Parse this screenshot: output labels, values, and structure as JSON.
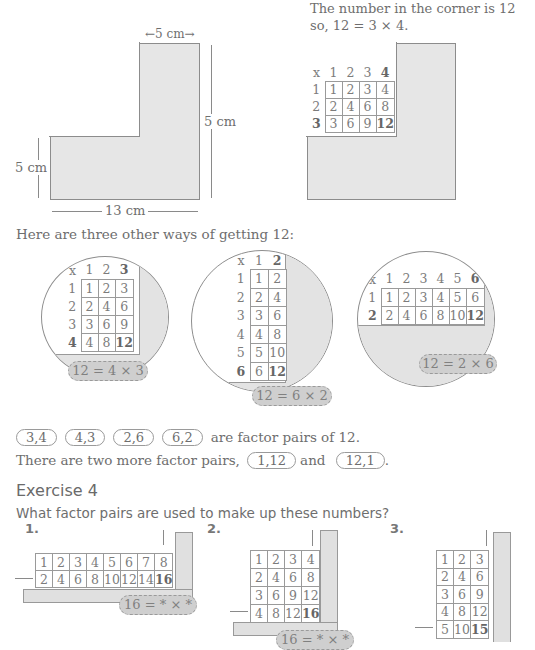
{
  "top_right_text": {
    "line1": "The number in the corner is 12",
    "line2": "so, 12 = 3 × 4."
  },
  "left_shape": {
    "top_dim": "←5 cm→",
    "right_dim": "5 cm",
    "left_dim": "5 cm",
    "bottom_dim": "13 cm"
  },
  "right_table": {
    "header": [
      "x",
      "1",
      "2",
      "3",
      "4"
    ],
    "rows": [
      [
        "1",
        "1",
        "2",
        "3",
        "4"
      ],
      [
        "2",
        "2",
        "4",
        "6",
        "8"
      ],
      [
        "3",
        "3",
        "6",
        "9",
        "12"
      ]
    ]
  },
  "intro": "Here are three other ways of getting 12:",
  "circles": [
    {
      "header": [
        "x",
        "1",
        "2",
        "3"
      ],
      "rows": [
        [
          "1",
          "1",
          "2",
          "3"
        ],
        [
          "2",
          "2",
          "4",
          "6"
        ],
        [
          "3",
          "3",
          "6",
          "9"
        ],
        [
          "4",
          "4",
          "8",
          "12"
        ]
      ],
      "label": "12 = 4 × 3"
    },
    {
      "header": [
        "x",
        "1",
        "2"
      ],
      "rows": [
        [
          "1",
          "1",
          "2"
        ],
        [
          "2",
          "2",
          "4"
        ],
        [
          "3",
          "3",
          "6"
        ],
        [
          "4",
          "4",
          "8"
        ],
        [
          "5",
          "5",
          "10"
        ],
        [
          "6",
          "6",
          "12"
        ]
      ],
      "label": "12 = 6 × 2"
    },
    {
      "header": [
        "x",
        "1",
        "2",
        "3",
        "4",
        "5",
        "6"
      ],
      "rows": [
        [
          "1",
          "1",
          "2",
          "3",
          "4",
          "5",
          "6"
        ],
        [
          "2",
          "2",
          "4",
          "6",
          "8",
          "10",
          "12"
        ]
      ],
      "label": "12 = 2 × 6"
    }
  ],
  "pairs": {
    "items": [
      "3,4",
      "4,3",
      "2,6",
      "6,2"
    ],
    "suffix": "are factor pairs of 12.",
    "line2_prefix": "There are two more factor pairs,",
    "extra1": "1,12",
    "and": "and",
    "extra2": "12,1",
    "end": "."
  },
  "exercise": {
    "title": "Exercise 4",
    "question": "What factor pairs are used to make up these numbers?",
    "items": [
      {
        "num": "1.",
        "rows": [
          [
            "1",
            "2",
            "3",
            "4",
            "5",
            "6",
            "7",
            "8"
          ],
          [
            "2",
            "4",
            "6",
            "8",
            "10",
            "12",
            "14",
            "16"
          ]
        ],
        "label": "16 = * × *"
      },
      {
        "num": "2.",
        "rows": [
          [
            "1",
            "2",
            "3",
            "4"
          ],
          [
            "2",
            "4",
            "6",
            "8"
          ],
          [
            "3",
            "6",
            "9",
            "12"
          ],
          [
            "4",
            "8",
            "12",
            "16"
          ]
        ],
        "label": "16 = * × *"
      },
      {
        "num": "3.",
        "rows": [
          [
            "1",
            "2",
            "3"
          ],
          [
            "2",
            "4",
            "6"
          ],
          [
            "3",
            "6",
            "9"
          ],
          [
            "4",
            "8",
            "12"
          ],
          [
            "5",
            "10",
            "15"
          ]
        ],
        "label": ""
      }
    ]
  }
}
